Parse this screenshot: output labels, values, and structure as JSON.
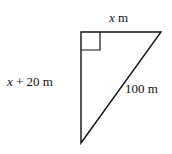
{
  "diagram": {
    "type": "right-triangle",
    "labels": {
      "top_side_var": "x",
      "top_side_unit": " m",
      "left_side_var": "x",
      "left_side_rest": " + 20 m",
      "hypotenuse": "100 m"
    },
    "right_angle_marker": true,
    "stroke_color": "#111111"
  }
}
